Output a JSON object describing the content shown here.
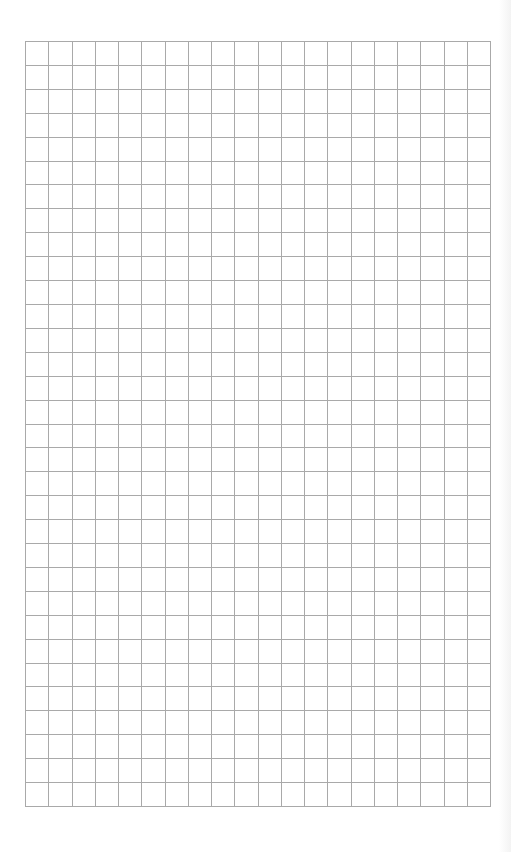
{
  "page": {
    "type": "graph-paper",
    "background_color": "#ffffff",
    "line_color": "#a9a9a9"
  },
  "grid": {
    "columns": 20,
    "rows": 32,
    "left": 25,
    "top": 41,
    "width": 466,
    "height": 766
  }
}
